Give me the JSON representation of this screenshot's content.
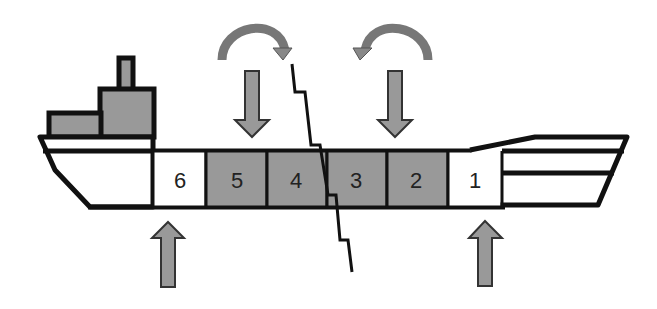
{
  "diagram": {
    "colors": {
      "outline": "#111111",
      "fill_gray": "#999999",
      "arrow_gray": "#8a8a8a",
      "empty": "#ffffff"
    },
    "holds": [
      {
        "label": "6",
        "state": "empty"
      },
      {
        "label": "5",
        "state": "loaded"
      },
      {
        "label": "4",
        "state": "loaded"
      },
      {
        "label": "3",
        "state": "loaded"
      },
      {
        "label": "2",
        "state": "loaded"
      },
      {
        "label": "1",
        "state": "empty"
      }
    ],
    "arrows": {
      "down": [
        "over hold 5",
        "over hold 2"
      ],
      "up": [
        "under hold 6",
        "under hold 1"
      ],
      "curved": [
        "clockwise over hold 5/4",
        "counter-clockwise over hold 3/2"
      ]
    },
    "crack": "zigzag fracture line between holds 4 and 3"
  }
}
